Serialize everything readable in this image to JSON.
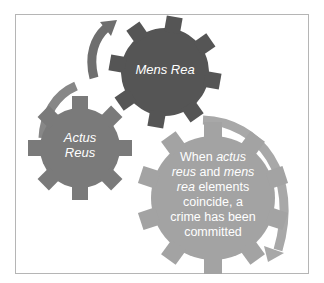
{
  "diagram": {
    "frame_border_color": "#b5b5b5",
    "gears": [
      {
        "id": "mens-rea",
        "label": "Mens Rea",
        "color": "#555555"
      },
      {
        "id": "actus-reus",
        "label_line1": "Actus",
        "label_line2": "Reus",
        "color": "#7a7a7a"
      },
      {
        "id": "coincide",
        "color": "#a3a3a3",
        "text_parts": {
          "p1": "When ",
          "p2": "actus",
          "p3": "reus",
          "p4": " and ",
          "p5": "mens",
          "p6": "rea",
          "p7": " elements",
          "p8": "coincide, a",
          "p9": "crime has been",
          "p10": "committed"
        }
      }
    ],
    "arrows": [
      {
        "id": "arrow-top",
        "direction": "up-right",
        "color": "#6e6e6e"
      },
      {
        "id": "arrow-left",
        "direction": "down-left",
        "color": "#878787"
      },
      {
        "id": "arrow-right",
        "direction": "down",
        "color": "#a8a8a8"
      }
    ]
  }
}
